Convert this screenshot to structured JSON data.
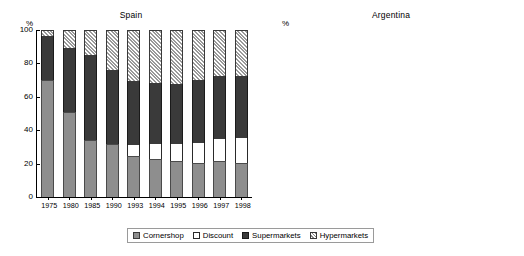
{
  "legend": {
    "items": [
      {
        "key": "cornershop",
        "label": "Cornershop",
        "color": "#8e8e8e",
        "pattern": "solid"
      },
      {
        "key": "discount",
        "label": "Discount",
        "color": "#ffffff",
        "pattern": "solid"
      },
      {
        "key": "supermarkets",
        "label": "Supermarkets",
        "color": "#3a3a3a",
        "pattern": "solid"
      },
      {
        "key": "hypermarkets",
        "label": "Hypermarkets",
        "color": "#d8d8d8",
        "pattern": "diagonal-hatch"
      }
    ]
  },
  "axis_unit_label": "%",
  "chart_data": [
    {
      "type": "bar",
      "stacked": true,
      "title": "Spain",
      "xlabel": "",
      "ylabel": "%",
      "ylim": [
        0,
        100
      ],
      "yticks": [
        0,
        20,
        40,
        60,
        80,
        100
      ],
      "grid": false,
      "legend_position": "bottom-center-shared",
      "categories": [
        "1975",
        "1980",
        "1985",
        "1990",
        "1993",
        "1994",
        "1995",
        "1996",
        "1997",
        "1998"
      ],
      "series": [
        {
          "name": "Cornershop",
          "values": [
            70.0,
            51.0,
            34.0,
            32.0,
            24.5,
            22.5,
            21.5,
            20.5,
            21.5,
            20.5
          ]
        },
        {
          "name": "Discount",
          "values": [
            0.0,
            0.0,
            0.0,
            0.0,
            6.5,
            9.5,
            10.5,
            12.0,
            13.5,
            15.0
          ]
        },
        {
          "name": "Supermarkets",
          "values": [
            26.5,
            38.0,
            51.0,
            44.0,
            38.5,
            36.0,
            35.5,
            37.5,
            37.5,
            37.0
          ]
        },
        {
          "name": "Hypermarkets",
          "values": [
            3.5,
            11.0,
            15.0,
            24.0,
            30.5,
            32.0,
            32.5,
            30.0,
            27.5,
            27.5
          ]
        }
      ],
      "cumulative_tops": {
        "Cornershop": [
          70.0,
          51.0,
          34.0,
          32.0,
          24.5,
          22.5,
          21.5,
          20.5,
          21.5,
          20.5
        ],
        "Discount": [
          70.0,
          51.0,
          34.0,
          32.0,
          31.0,
          32.0,
          32.0,
          32.5,
          35.0,
          35.5
        ],
        "Supermarkets": [
          96.5,
          89.0,
          85.0,
          76.0,
          69.5,
          68.0,
          67.5,
          70.0,
          72.5,
          72.5
        ],
        "Hypermarkets": [
          100,
          100,
          100,
          100,
          100,
          100,
          100,
          100,
          100,
          100
        ]
      }
    },
    {
      "type": "bar",
      "stacked": true,
      "title": "Argentina",
      "xlabel": "",
      "ylabel": "%",
      "ylim": [
        0,
        100
      ],
      "yticks": [
        0,
        10,
        20,
        30,
        40,
        50,
        60,
        70,
        80,
        90,
        100
      ],
      "grid": false,
      "legend_position": "bottom-center-shared",
      "categories": [
        "1975",
        "1980",
        "1985",
        "1990",
        "1993",
        "1994",
        "1995",
        "1996",
        "1997",
        "1998"
      ],
      "series": [
        {
          "name": "Cornershop",
          "values": [
            84.5,
            76.0,
            72.5,
            59.0,
            49.5,
            44.0,
            38.0,
            37.0,
            38.0,
            38.0
          ]
        },
        {
          "name": "Discount",
          "values": [
            0.0,
            0.0,
            0.0,
            0.0,
            0.0,
            0.0,
            0.0,
            0.0,
            0.0,
            0.0
          ]
        },
        {
          "name": "Supermarkets",
          "values": [
            15.5,
            24.0,
            27.5,
            33.5,
            38.0,
            38.0,
            36.5,
            34.0,
            34.5,
            33.5
          ]
        },
        {
          "name": "Hypermarkets",
          "values": [
            0.0,
            0.0,
            0.0,
            7.5,
            12.5,
            18.0,
            25.5,
            29.0,
            27.5,
            28.5
          ]
        }
      ],
      "cumulative_tops": {
        "Cornershop": [
          84.5,
          76.0,
          72.5,
          59.0,
          49.5,
          44.0,
          38.0,
          37.0,
          38.0,
          38.0
        ],
        "Discount": [
          84.5,
          76.0,
          72.5,
          59.0,
          49.5,
          44.0,
          38.0,
          37.0,
          38.0,
          38.0
        ],
        "Supermarkets": [
          100.0,
          100.0,
          100.0,
          92.5,
          87.5,
          82.0,
          74.5,
          71.0,
          72.5,
          71.5
        ],
        "Hypermarkets": [
          100,
          100,
          100,
          100,
          100,
          100,
          100,
          100,
          100,
          100
        ]
      }
    }
  ]
}
